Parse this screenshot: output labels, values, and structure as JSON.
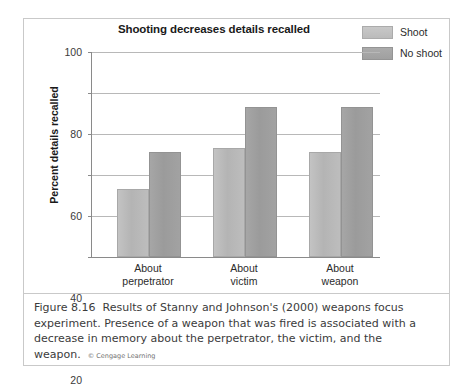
{
  "figure": {
    "caption_number": "Figure 8.16",
    "caption_text": "Results of Stanny and Johnson's (2000) weapons focus experiment. Presence of a weapon that was fired is associated with a decrease in memory about the perpetrator, the victim, and the weapon.",
    "copyright": "© Cengage Learning"
  },
  "chart_data": {
    "type": "bar",
    "title": "Shooting decreases details recalled",
    "xlabel": "",
    "ylabel": "Percent details recalled",
    "categories": [
      "About perpetrator",
      "About victim",
      "About weapon"
    ],
    "category_lines": [
      [
        "About",
        "perpetrator"
      ],
      [
        "About",
        "victim"
      ],
      [
        "About",
        "weapon"
      ]
    ],
    "series": [
      {
        "name": "Shoot",
        "values": [
          33,
          53,
          51
        ],
        "color": "#bbbbbb"
      },
      {
        "name": "No shoot",
        "values": [
          51,
          73,
          73
        ],
        "color": "#a0a0a0"
      }
    ],
    "ylim": [
      0,
      100
    ],
    "yticks": [
      0,
      20,
      40,
      60,
      80,
      100
    ],
    "grid": true,
    "legend_position": "top-right"
  }
}
